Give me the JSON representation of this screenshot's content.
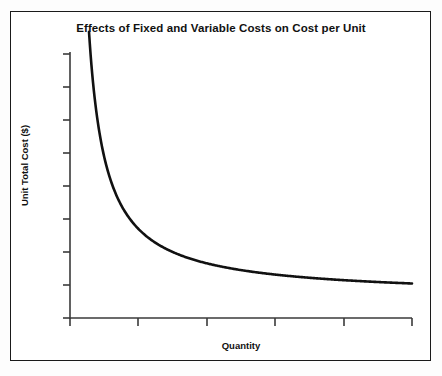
{
  "chart_data": {
    "type": "line",
    "title": "Effects of Fixed and Variable Costs on Cost per Unit",
    "xlabel": "Quantity",
    "ylabel": "Unit Total Cost ($)",
    "grid": false,
    "legend": null,
    "axis_tick_labels": {
      "x": [],
      "y": []
    },
    "xlim": [
      0,
      100
    ],
    "ylim": [
      0,
      100
    ],
    "x_tick_count": 6,
    "y_tick_count": 9,
    "series": [
      {
        "name": "Unit Total Cost",
        "description": "Hyperbolic decline of unit total cost as quantity rises, flattening toward a variable-cost asymptote",
        "x": [
          5,
          7,
          9,
          11,
          14,
          17,
          20,
          25,
          30,
          35,
          40,
          45,
          50,
          60,
          70,
          80,
          90,
          100
        ],
        "y": [
          100,
          78,
          63,
          53,
          43,
          36,
          31,
          26,
          23,
          20,
          18.5,
          17.3,
          16.4,
          15.2,
          14.4,
          13.9,
          13.6,
          13.4
        ]
      }
    ]
  },
  "figure": {
    "line_color": "#111111",
    "axis_color": "#3a3a3a",
    "frame_color": "#1a1a1a",
    "background": "#ffffff"
  }
}
